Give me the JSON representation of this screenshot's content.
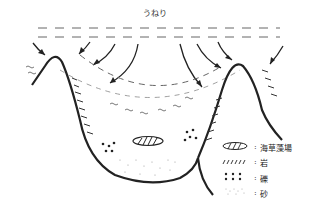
{
  "title": "うねり",
  "legend": [
    {
      "symbol": "hatched-ellipse",
      "label": "海草藻場"
    },
    {
      "symbol": "diagonal-strokes",
      "label": "岩"
    },
    {
      "symbol": "dots-large",
      "label": "礫"
    },
    {
      "symbol": "dots-fine",
      "label": "砂"
    }
  ],
  "separator": ":"
}
